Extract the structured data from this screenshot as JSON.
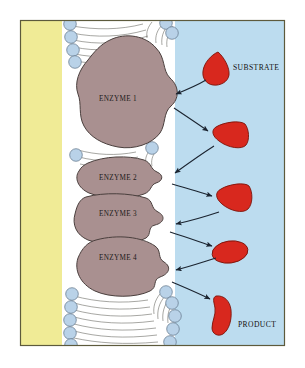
{
  "figure": {
    "frame": {
      "border_color": "#5d5a3c",
      "background": "#ffffff"
    },
    "regions": {
      "cytoplasm": {
        "label": "cytoplasm-region",
        "color": "#f0eb96"
      },
      "membrane": {
        "label": "phospholipid-bilayer",
        "tail_color": "#ffffff",
        "tail_stroke": "#5a5a55",
        "head_color": "#b9d2e8",
        "head_stroke": "#5f7286"
      },
      "extracellular": {
        "label": "extracellular-region",
        "color": "#bcdcef"
      }
    },
    "enzymes": [
      {
        "id": "enzyme-1",
        "label": "ENZYME 1",
        "label_x": 118,
        "label_y": 101
      },
      {
        "id": "enzyme-2",
        "label": "ENZYME 2",
        "label_x": 118,
        "label_y": 180
      },
      {
        "id": "enzyme-3",
        "label": "ENZYME 3",
        "label_x": 118,
        "label_y": 215
      },
      {
        "id": "enzyme-4",
        "label": "ENZYME 4",
        "label_x": 118,
        "label_y": 259
      }
    ],
    "enzyme_style": {
      "fill": "#a99090",
      "stroke": "#4a3f3d"
    },
    "molecules": [
      {
        "id": "substrate-molecule",
        "shape": "teardrop",
        "cx": 218,
        "cy": 68,
        "color": "#d8281e"
      },
      {
        "id": "intermediate-molecule-1",
        "shape": "triangle",
        "cx": 228,
        "cy": 134,
        "color": "#d8281e"
      },
      {
        "id": "intermediate-molecule-2",
        "shape": "triangle",
        "cx": 233,
        "cy": 198,
        "color": "#d8281e"
      },
      {
        "id": "intermediate-molecule-3",
        "shape": "ellipse",
        "cx": 230,
        "cy": 252,
        "color": "#d8281e"
      },
      {
        "id": "product-molecule",
        "shape": "curved-bean",
        "cx": 225,
        "cy": 314,
        "color": "#d8281e"
      }
    ],
    "molecule_style": {
      "fill": "#d8281e",
      "stroke": "#7d1309"
    },
    "annotations": [
      {
        "id": "substrate-label",
        "text": "SUBSTRATE",
        "x": 233,
        "y": 70
      },
      {
        "id": "product-label",
        "text": "PRODUCT",
        "x": 238,
        "y": 327
      }
    ],
    "arrows": {
      "stroke": "#1b2430",
      "count": 8,
      "description": "curved arrows alternating between enzyme active sites and substrate molecules"
    }
  }
}
